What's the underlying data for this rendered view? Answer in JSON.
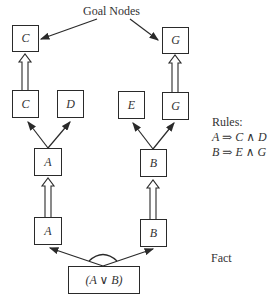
{
  "diagram": {
    "goal_label": "Goal Nodes",
    "fact_label": "Fact",
    "rules_title": "Rules:",
    "rules": [
      "A ⇒ C ∧ D",
      "B ⇒ E ∧ G"
    ],
    "nodes": {
      "goal_c": "C",
      "goal_g": "G",
      "c": "C",
      "d": "D",
      "e": "E",
      "g": "G",
      "a_rule": "A",
      "b_rule": "B",
      "a_fact": "A",
      "b_fact": "B",
      "fact": "(A ∨ B)"
    },
    "colors": {
      "stroke": "#2a2a2a",
      "background": "#ffffff"
    }
  }
}
